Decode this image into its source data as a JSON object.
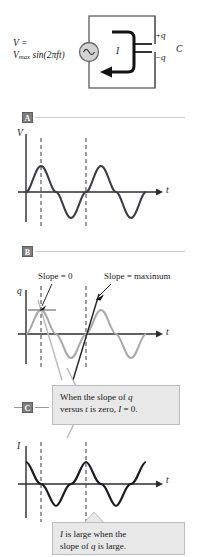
{
  "figure": {
    "title_parts": {
      "circuit": {
        "voltage_equation_line1": "V =",
        "voltage_equation_line2_prefix": "V",
        "voltage_equation_line2_sub": "max",
        "voltage_equation_line2_rest": "sin(2πft)",
        "current_label": "I",
        "capacitor_label": "C",
        "charge_positive": "+q",
        "charge_negative": "−q",
        "source_icon": "ac-source-sine-icon"
      }
    },
    "panels": [
      {
        "badge": "A",
        "y_axis_label": "V",
        "x_axis_label": "t",
        "curve": "sine",
        "curve_color": "#3c3c46"
      },
      {
        "badge": "B",
        "y_axis_label": "q",
        "x_axis_label": "t",
        "curve": "sine",
        "curve_color": "#a9a9a9",
        "annotations": [
          {
            "text": "Slope = 0"
          },
          {
            "text": "Slope = maximum"
          }
        ]
      },
      {
        "badge": "C",
        "y_axis_label": "I",
        "x_axis_label": "t",
        "curve": "cosine",
        "curve_color": "#1c1c22"
      }
    ],
    "callouts": [
      {
        "id": "callout-slope-zero",
        "line1_a": "When the slope of ",
        "line1_i": "q",
        "line2_a": "versus ",
        "line2_i1": "t",
        "line2_b": " is zero, ",
        "line2_i2": "I",
        "line2_c": " = 0."
      },
      {
        "id": "callout-current-large",
        "line1_i": "I",
        "line1_a": " is large when the",
        "line2_a": "slope of ",
        "line2_i": "q",
        "line2_b": " is large."
      }
    ],
    "colors": {
      "ink": "#1a1a1a",
      "dark_curve": "#3c3c46",
      "light_curve": "#a9a9a9",
      "badge_bg": "#7d7d7d",
      "callout_bg": "#e8e8e8",
      "rule": "#cfcfcf"
    }
  }
}
